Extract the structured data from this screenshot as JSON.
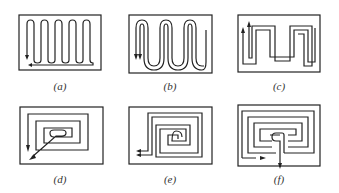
{
  "figure": {
    "stroke_color": "#222222",
    "panels": [
      {
        "id": "a",
        "label": "(a)",
        "pattern": "single serpentine, arrow down at left, return along bottom"
      },
      {
        "id": "b",
        "label": "(b)",
        "pattern": "double serpentine, two arrows down at left"
      },
      {
        "id": "c",
        "label": "(c)",
        "pattern": "double serpentine (interleaved), two arrows up at left"
      },
      {
        "id": "d",
        "label": "(d)",
        "pattern": "rectangular spiral, diagonal exit arrow bottom-left"
      },
      {
        "id": "e",
        "label": "(e)",
        "pattern": "counter-flow double spiral, two arrows left at bottom-left"
      },
      {
        "id": "f",
        "label": "(f)",
        "pattern": "counter-flow double spiral, entry/exit at bottom-centre"
      }
    ]
  }
}
